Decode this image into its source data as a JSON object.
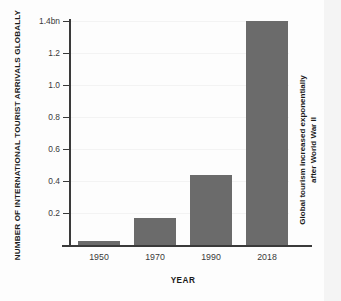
{
  "chart_data": {
    "type": "bar",
    "title": "",
    "categories": [
      "1950",
      "1970",
      "1990",
      "2018"
    ],
    "values": [
      0.025,
      0.166,
      0.44,
      1.4
    ],
    "xlabel": "YEAR",
    "ylabel": "NUMBER OF INTERNATIONAL TOURIST ARRIVALS GLOBALLY",
    "ylim": [
      0,
      1.4
    ],
    "yticks": [
      0.2,
      0.4,
      0.6,
      0.8,
      1.0,
      1.2,
      1.4
    ],
    "ytick_labels": [
      "0.2",
      "0.4",
      "0.6",
      "0.8",
      "1.0",
      "1.2",
      "1.4bn"
    ],
    "unit": "bn",
    "grid": true,
    "legend": "none",
    "bar_color": "#6b6b6b",
    "axis_color": "#3a3a3a",
    "background_color": "#fdfdfd",
    "annotations": [
      {
        "name": "side-note",
        "line1": "Global tourism increased exponentially",
        "line2": "after World War II",
        "position": "right",
        "orientation": "vertical"
      }
    ]
  }
}
